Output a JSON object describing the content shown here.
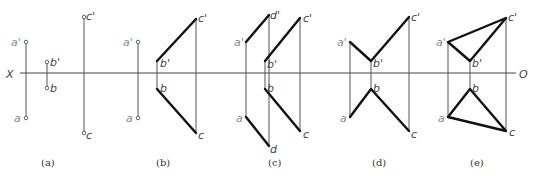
{
  "axis": {
    "left_label": "X",
    "right_label": "O"
  },
  "panels": [
    {
      "caption": "(a)",
      "labels": {
        "a_prime": "a'",
        "a": "a",
        "b_prime": "b'",
        "b": "b",
        "c_prime": "c'",
        "c": "c"
      }
    },
    {
      "caption": "(b)",
      "labels": {
        "a_prime": "a'",
        "a": "a",
        "b_prime": "b'",
        "b": "b",
        "c_prime": "c'",
        "c": "c"
      }
    },
    {
      "caption": "(c)",
      "labels": {
        "a_prime": "a'",
        "a": "a",
        "b_prime": "b'",
        "b": "b",
        "c_prime": "c'",
        "c": "c",
        "d_prime": "d'",
        "d": "d"
      }
    },
    {
      "caption": "(d)",
      "labels": {
        "a_prime": "a'",
        "a": "a",
        "b_prime": "b'",
        "b": "b",
        "c_prime": "c'",
        "c": "c"
      }
    },
    {
      "caption": "(e)",
      "labels": {
        "a_prime": "a'",
        "a": "a",
        "b_prime": "b'",
        "b": "b",
        "c_prime": "c'",
        "c": "c"
      }
    }
  ],
  "colors": {
    "thick_line": "#111111",
    "thin_line": "#555555",
    "label": "#444444"
  }
}
